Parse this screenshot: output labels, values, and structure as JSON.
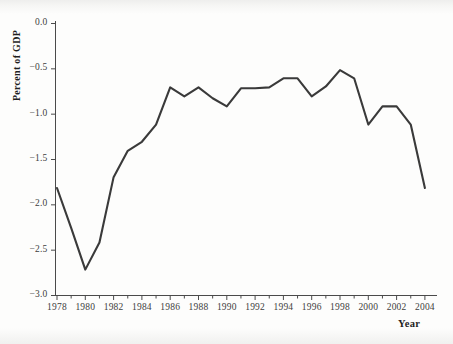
{
  "chart_data": {
    "type": "line",
    "title": "",
    "subtitle": "",
    "xlabel": "Year",
    "ylabel": "Percent of GDP",
    "xlim": [
      1977.4,
      2004.6
    ],
    "ylim": [
      -3.0,
      0.0
    ],
    "grid": false,
    "legend": null,
    "legend_position": "none",
    "x_ticks": [
      1978,
      1980,
      1982,
      1984,
      1986,
      1988,
      1990,
      1992,
      1994,
      1996,
      1998,
      2000,
      2002,
      2004
    ],
    "x_tick_labels": [
      "1978",
      "1980",
      "1982",
      "1984",
      "1986",
      "1988",
      "1990",
      "1992",
      "1994",
      "1996",
      "1998",
      "2000",
      "2002",
      "2004"
    ],
    "x_minor_tick_step": 1,
    "y_ticks": [
      0.0,
      -0.5,
      -1.0,
      -1.5,
      -2.0,
      -2.5,
      -3.0
    ],
    "y_tick_labels": [
      "0.0",
      "-0.5",
      "-1.0",
      "-1.5",
      "-2.0",
      "-2.5",
      "-3.0"
    ],
    "line_color": "#3a3a3a",
    "axis_color": "#4a4a4a",
    "series": [
      {
        "name": "Percent of GDP",
        "x": [
          1978,
          1979,
          1980,
          1981,
          1982,
          1983,
          1984,
          1985,
          1986,
          1987,
          1988,
          1989,
          1990,
          1991,
          1992,
          1993,
          1994,
          1995,
          1996,
          1997,
          1998,
          1999,
          2000,
          2001,
          2002,
          2003,
          2004
        ],
        "values": [
          -1.82,
          -2.26,
          -2.72,
          -2.42,
          -1.7,
          -1.41,
          -1.31,
          -1.12,
          -0.71,
          -0.81,
          -0.71,
          -0.83,
          -0.92,
          -0.72,
          -0.72,
          -0.71,
          -0.61,
          -0.61,
          -0.81,
          -0.7,
          -0.52,
          -0.61,
          -1.12,
          -0.92,
          -0.92,
          -1.12,
          -1.82
        ]
      }
    ]
  },
  "axis_titles": {
    "y": "Percent of GDP",
    "x": "Year"
  }
}
